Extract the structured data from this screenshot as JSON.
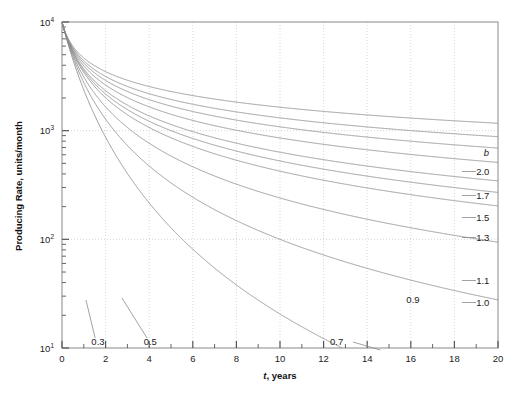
{
  "chart_data": {
    "type": "line",
    "title": "",
    "xlabel": "t, years",
    "ylabel": "Producing Rate, units/month",
    "xlim": [
      0,
      20
    ],
    "ylim": [
      10,
      10000
    ],
    "yscale": "log",
    "xscale": "linear",
    "grid": "dotted gridlines at major x ticks and decade y ticks",
    "legend_position": "right-edge curve end labels",
    "legend_title": "b",
    "xticks": [
      "0",
      "2",
      "4",
      "6",
      "8",
      "10",
      "12",
      "14",
      "16",
      "18",
      "20"
    ],
    "xticks_minor": [
      1,
      3,
      5,
      7,
      9,
      11,
      13,
      15,
      17,
      19
    ],
    "yticks": [
      "10¹",
      "10²",
      "10³",
      "10⁴"
    ],
    "ytick_bases": [
      "10",
      "10",
      "10",
      "10"
    ],
    "ytick_exps": [
      "1",
      "2",
      "3",
      "4"
    ],
    "initial_rate": 10000,
    "decline_nominal_per_year": 1.8,
    "series": [
      {
        "name": "0.3",
        "b": 0.3,
        "label": "0.3",
        "label_x": 1.65,
        "label_y_px": 345,
        "leader": true,
        "leader_from_x": 1.52,
        "leader_from_y_px": 338,
        "leader_to_x": 1.1,
        "leader_to_y_px": 300
      },
      {
        "name": "0.5",
        "b": 0.5,
        "label": "0.5",
        "label_x": 4.05,
        "label_y_px": 345,
        "leader": true,
        "leader_from_x": 3.9,
        "leader_from_y_px": 338,
        "leader_to_x": 2.75,
        "leader_to_y_px": 298
      },
      {
        "name": "0.7",
        "b": 0.7,
        "label": "0.7",
        "label_x": 12.6,
        "label_y_px": 345,
        "leader": true,
        "leader_from_x": 13.35,
        "leader_from_y_px": 342,
        "leader_to_x": 14.6,
        "leader_to_y_px": 350
      },
      {
        "name": "0.9",
        "b": 0.9,
        "label": "0.9",
        "label_x": 16.1,
        "label_y_px": 303,
        "leader": false
      },
      {
        "name": "1.0",
        "b": 1.0,
        "label": "1.0",
        "label_x": 19.3,
        "label_y_px": 306,
        "leader": false
      },
      {
        "name": "1.1",
        "b": 1.1,
        "label": "1.1",
        "label_x": 19.3,
        "label_y_px": 284,
        "leader": false
      },
      {
        "name": "1.3",
        "b": 1.3,
        "label": "1.3",
        "label_x": 19.3,
        "label_y_px": 241,
        "leader": false
      },
      {
        "name": "1.5",
        "b": 1.5,
        "label": "1.5",
        "label_x": 19.3,
        "label_y_px": 221,
        "leader": false
      },
      {
        "name": "1.7",
        "b": 1.7,
        "label": "1.7",
        "label_x": 19.3,
        "label_y_px": 199,
        "leader": false
      },
      {
        "name": "2.0",
        "b": 2.0,
        "label": "2.0",
        "label_x": 19.3,
        "label_y_px": 175,
        "leader": false
      }
    ],
    "colors": {
      "curve": "#8a8a8a",
      "axis": "#888888",
      "grid": "#cccccc",
      "text": "#1a1a1a",
      "background": "#ffffff"
    }
  },
  "axes": {
    "y_title": "Producing Rate, units/month",
    "x_title": "t, years",
    "legend_head": "b"
  },
  "xtick_labels": [
    "0",
    "2",
    "4",
    "6",
    "8",
    "10",
    "12",
    "14",
    "16",
    "18",
    "20"
  ],
  "ytick_labels": [
    {
      "base": "10",
      "exp": "1"
    },
    {
      "base": "10",
      "exp": "2"
    },
    {
      "base": "10",
      "exp": "3"
    },
    {
      "base": "10",
      "exp": "4"
    }
  ]
}
